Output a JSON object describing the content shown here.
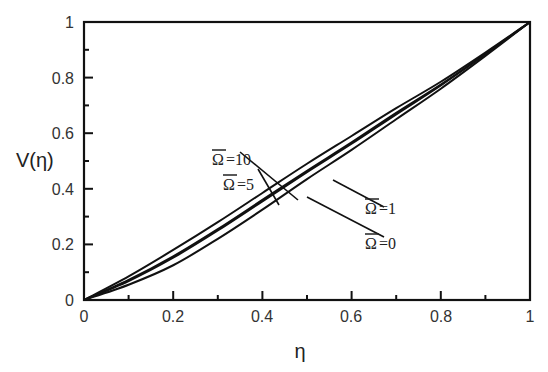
{
  "chart_data": {
    "type": "line",
    "title": "",
    "xlabel": "η",
    "ylabel": "V(η)",
    "xlim": [
      0,
      1
    ],
    "ylim": [
      0,
      1
    ],
    "grid": false,
    "legend": "none (inline annotations with leader lines)",
    "x_ticks": [
      "0",
      "0.2",
      "0.4",
      "0.6",
      "0.8",
      "1"
    ],
    "y_ticks": [
      "0",
      "0.2",
      "0.4",
      "0.6",
      "0.8",
      "1"
    ],
    "x": [
      0,
      0.1,
      0.2,
      0.3,
      0.4,
      0.5,
      0.6,
      0.7,
      0.8,
      0.9,
      1.0
    ],
    "series": [
      {
        "name": "Ω̄=10",
        "values": [
          0,
          0.085,
          0.18,
          0.28,
          0.385,
          0.49,
          0.59,
          0.69,
          0.785,
          0.89,
          1.0
        ]
      },
      {
        "name": "Ω̄=5",
        "values": [
          0,
          0.072,
          0.157,
          0.255,
          0.36,
          0.465,
          0.567,
          0.673,
          0.775,
          0.885,
          1.0
        ]
      },
      {
        "name": "Ω̄=1",
        "values": [
          0,
          0.068,
          0.152,
          0.25,
          0.355,
          0.46,
          0.562,
          0.668,
          0.772,
          0.884,
          1.0
        ]
      },
      {
        "name": "Ω̄=0",
        "values": [
          0,
          0.055,
          0.125,
          0.22,
          0.325,
          0.435,
          0.54,
          0.65,
          0.76,
          0.878,
          1.0
        ]
      }
    ],
    "annotations": [
      {
        "text": "Ω̄=10",
        "label_x": 0.18,
        "label_y": 0.55
      },
      {
        "text": "Ω̄=5",
        "label_x": 0.28,
        "label_y": 0.48
      },
      {
        "text": "Ω̄=1",
        "label_x": 0.62,
        "label_y": 0.3
      },
      {
        "text": "Ω̄=0",
        "label_x": 0.62,
        "label_y": 0.2
      }
    ]
  },
  "labels": {
    "x_axis": "η",
    "y_axis": "V(η)",
    "ann_10_sym": "Ω",
    "ann_10_val": "=10",
    "ann_5_sym": "Ω",
    "ann_5_val": "=5",
    "ann_1_sym": "Ω",
    "ann_1_val": "=1",
    "ann_0_sym": "Ω",
    "ann_0_val": "=0",
    "xt0": "0",
    "xt1": "0.2",
    "xt2": "0.4",
    "xt3": "0.6",
    "xt4": "0.8",
    "xt5": "1",
    "yt0": "0",
    "yt1": "0.2",
    "yt2": "0.4",
    "yt3": "0.6",
    "yt4": "0.8",
    "yt5": "1"
  }
}
